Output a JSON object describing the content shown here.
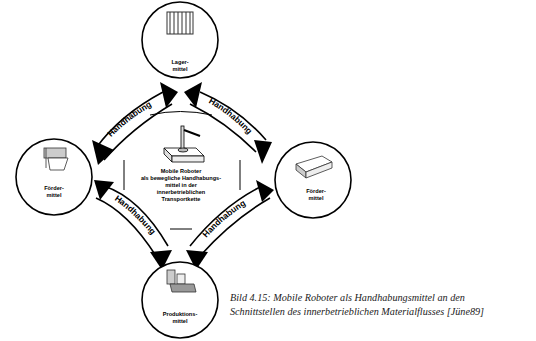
{
  "diagram": {
    "center": {
      "lines": [
        "Mobile Roboter",
        "als bewegliche Handhabungs-",
        "mittel in der",
        "innerbetrieblichen",
        "Transportkette"
      ],
      "icon": "mobile-robot-icon"
    },
    "nodes": [
      {
        "id": "top",
        "lines": [
          "Lager-",
          "mittel"
        ],
        "icon": "storage-rack-icon"
      },
      {
        "id": "left",
        "lines": [
          "Förder-",
          "mittel"
        ],
        "icon": "conveyor-icon"
      },
      {
        "id": "right",
        "lines": [
          "Förder-",
          "mittel"
        ],
        "icon": "transport-vehicle-icon"
      },
      {
        "id": "bottom",
        "lines": [
          "Produktions-",
          "mittel"
        ],
        "icon": "production-machine-icon"
      }
    ],
    "arrows": [
      {
        "from": "center",
        "to": "top-left",
        "label": "Handhabung"
      },
      {
        "from": "center",
        "to": "top-right",
        "label": "Handhabung"
      },
      {
        "from": "center",
        "to": "bottom-left",
        "label": "Handhabung"
      },
      {
        "from": "center",
        "to": "bottom-right",
        "label": "Handhabung"
      }
    ],
    "colors": {
      "stroke": "#000000",
      "fill": "#ffffff",
      "text": "#000000"
    }
  },
  "caption": {
    "line1": "Bild 4.15: Mobile Roboter als Handhabungsmittel an den",
    "line2": "Schnittstellen des innerbetrieblichen Materialflusses [Jüne89]"
  }
}
